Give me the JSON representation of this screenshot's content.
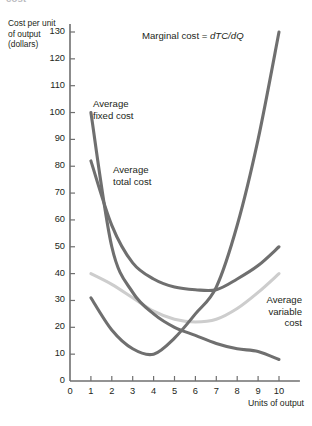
{
  "figure": {
    "clipped_caption": "cost",
    "y_axis_title": "Cost per unit of output (dollars)",
    "x_axis_title": "Units of output"
  },
  "annotations": {
    "average_fixed_cost": "Average\nfixed cost",
    "average_total_cost": "Average\ntotal cost",
    "average_variable_cost": "Average\nvariable\ncost",
    "marginal_cost_prefix": "Marginal cost = ",
    "marginal_cost_formula": "dTC/dQ"
  },
  "colors": {
    "dark_curve": "#6f6f6f",
    "light_curve": "#cdcdcd",
    "axis": "#6f6f6f",
    "text": "#231f20"
  },
  "chart_data": {
    "type": "line",
    "title": "",
    "xlabel": "Units of output",
    "ylabel": "Cost per unit of output (dollars)",
    "xlim": [
      0,
      11
    ],
    "ylim": [
      0,
      130
    ],
    "xticks": [
      0,
      1,
      2,
      3,
      4,
      5,
      6,
      7,
      8,
      9,
      10
    ],
    "yticks": [
      0,
      10,
      20,
      30,
      40,
      50,
      60,
      70,
      80,
      90,
      100,
      110,
      120,
      130
    ],
    "grid": false,
    "legend": "inline-annotations",
    "x": [
      1,
      2,
      3,
      4,
      5,
      6,
      7,
      8,
      9,
      10
    ],
    "series": [
      {
        "name": "Average fixed cost",
        "color": "#6f6f6f",
        "values": [
          100,
          50,
          33,
          25,
          20,
          17,
          14,
          12,
          11,
          8
        ]
      },
      {
        "name": "Average total cost",
        "color": "#6f6f6f",
        "values": [
          82,
          58,
          44,
          38,
          35,
          34,
          34,
          38,
          43,
          50
        ]
      },
      {
        "name": "Average variable cost",
        "color": "#cdcdcd",
        "values": [
          40,
          36,
          31,
          26,
          23,
          22,
          23,
          27,
          33,
          40
        ]
      },
      {
        "name": "Marginal cost",
        "color": "#6f6f6f",
        "values": [
          31,
          19,
          12,
          10,
          16,
          25,
          35,
          58,
          90,
          130
        ]
      }
    ]
  }
}
